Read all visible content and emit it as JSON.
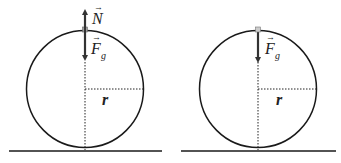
{
  "diagrams": [
    {
      "id": "left",
      "force_up_label": "N",
      "force_down_label": "F",
      "force_down_subscript": "g",
      "radius_label": "r"
    },
    {
      "id": "right",
      "force_down_label": "F",
      "force_down_subscript": "g",
      "radius_label": "r"
    }
  ],
  "colors": {
    "line": "#1a1a1a",
    "box": "#9a9a9a"
  }
}
